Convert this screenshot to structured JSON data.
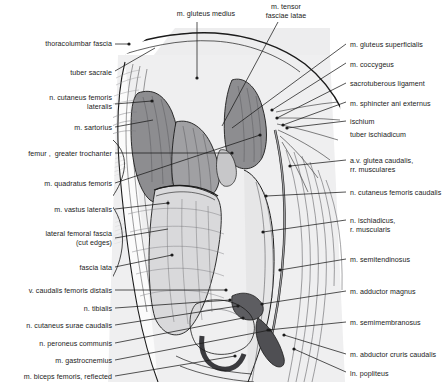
{
  "figure": {
    "background_color": "#ffffff",
    "illustration_tint": "#ececed",
    "muscle_fill_dark": "#8d8d90",
    "muscle_fill_mid": "#a8a8ab",
    "muscle_fill_light": "#c9c9cb",
    "line_color": "#1b1b1b",
    "label_color": "#1b1b1b"
  },
  "labels_top": [
    {
      "id": "m-gluteus-medius",
      "text": "m. gluteus medius",
      "x": 164,
      "y": 10,
      "align": "center",
      "width": 84
    },
    {
      "id": "m-tensor-fasciae-latae",
      "text": "m. tensor\nfasciae latae",
      "x": 253,
      "y": 3,
      "align": "center",
      "width": 66
    }
  ],
  "labels_left": [
    {
      "id": "thoracolumbar-fascia",
      "text": "thoracolumbar fascia",
      "x": 22,
      "y": 40,
      "width": 90
    },
    {
      "id": "tuber-sacrale",
      "text": "tuber sacrale",
      "x": 52,
      "y": 69,
      "width": 60
    },
    {
      "id": "n-cutaneus-femoris-lateralis",
      "text": "n. cutaneus femoris\nlateralis",
      "x": 22,
      "y": 94,
      "width": 90
    },
    {
      "id": "m-sartorius",
      "text": "m. sartorius",
      "x": 52,
      "y": 124,
      "width": 60
    },
    {
      "id": "femur-greater-trochanter",
      "text": "femur ,  greater trochanter",
      "x": 2,
      "y": 150,
      "width": 110
    },
    {
      "id": "m-quadratus-femoris",
      "text": "m. quadratus femoris",
      "x": 22,
      "y": 180,
      "width": 90
    },
    {
      "id": "m-vastus-lateralis",
      "text": "m. vastus lateralis",
      "x": 32,
      "y": 206,
      "width": 80
    },
    {
      "id": "lateral-femoral-fascia",
      "text": "lateral femoral fascia\n(cut edges)",
      "x": 22,
      "y": 230,
      "width": 90
    },
    {
      "id": "fascia-lata",
      "text": "fascia lata",
      "x": 52,
      "y": 264,
      "width": 60
    },
    {
      "id": "v-caudalis-femoris-distalis",
      "text": "v. caudalis femoris distalis",
      "x": 9,
      "y": 287,
      "width": 103
    },
    {
      "id": "n-tibialis",
      "text": "n. tibialis",
      "x": 62,
      "y": 305,
      "width": 50
    },
    {
      "id": "n-cutaneus-surae-caudalis",
      "text": "n. cutaneus surae caudalis",
      "x": 8,
      "y": 322,
      "width": 104
    },
    {
      "id": "n-peroneus-communis",
      "text": "n. peroneus communis",
      "x": 20,
      "y": 340,
      "width": 92
    },
    {
      "id": "m-gastrocnemius",
      "text": "m. gastrocnemius",
      "x": 36,
      "y": 357,
      "width": 76
    },
    {
      "id": "m-biceps-femoris-reflected",
      "text": "m. biceps femoris, reflected",
      "x": 5,
      "y": 373,
      "width": 107
    }
  ],
  "labels_right": [
    {
      "id": "m-gluteus-superficialis",
      "text": "m. gluteus superficialis",
      "x": 350,
      "y": 41,
      "width": 93
    },
    {
      "id": "m-coccygeus",
      "text": "m. coccygeus",
      "x": 350,
      "y": 61,
      "width": 93
    },
    {
      "id": "sacrotuberous-ligament",
      "text": "sacrotuberous ligament",
      "x": 350,
      "y": 80,
      "width": 93
    },
    {
      "id": "m-sphincter-ani-externus",
      "text": "m. sphincter ani externus",
      "x": 350,
      "y": 100,
      "width": 93
    },
    {
      "id": "ischium",
      "text": "ischium",
      "x": 350,
      "y": 118,
      "width": 93
    },
    {
      "id": "tuber-ischiadicum",
      "text": "tuber ischiadicum",
      "x": 350,
      "y": 131,
      "width": 93
    },
    {
      "id": "av-glutea-caudalis",
      "text": "a.v. glutea caudalis,\nrr. musculares",
      "x": 350,
      "y": 157,
      "width": 93
    },
    {
      "id": "n-cutaneus-femoris-caudalis",
      "text": "n. cutaneus femoris caudalis",
      "x": 350,
      "y": 189,
      "width": 93
    },
    {
      "id": "n-ischiadicus-r-muscularis",
      "text": "n. ischiadicus,\nr. muscularis",
      "x": 350,
      "y": 217,
      "width": 93
    },
    {
      "id": "m-semitendinosus",
      "text": "m. semitendinosus",
      "x": 350,
      "y": 256,
      "width": 93
    },
    {
      "id": "m-adductor-magnus",
      "text": "m. adductor magnus",
      "x": 350,
      "y": 288,
      "width": 93
    },
    {
      "id": "m-semimembranosus",
      "text": "m. semimembranosus",
      "x": 350,
      "y": 319,
      "width": 93
    },
    {
      "id": "m-abductor-cruris-caudalis",
      "text": "m. abductor cruris caudalis",
      "x": 350,
      "y": 351,
      "width": 93
    },
    {
      "id": "ln-popliteus",
      "text": "ln. popliteus",
      "x": 350,
      "y": 370,
      "width": 93
    }
  ],
  "leader_lines": [
    {
      "id": "ll-thoracolumbar-fascia",
      "from": [
        115,
        44
      ],
      "to": [
        128,
        44
      ],
      "dot": [
        129,
        44
      ]
    },
    {
      "id": "ll-tuber-sacrale",
      "from": [
        115,
        71
      ],
      "to": [
        155,
        48
      ],
      "dot": null
    },
    {
      "id": "ll-n-cutaneus-femoris-lateralis",
      "from": [
        115,
        104
      ],
      "to": [
        152,
        101
      ],
      "dot": [
        152,
        101
      ]
    },
    {
      "id": "ll-m-sartorius",
      "from": [
        115,
        127
      ],
      "to": [
        153,
        120
      ],
      "dot": null
    },
    {
      "id": "ll-femur-greater-trochanter",
      "from": [
        115,
        153
      ],
      "to": [
        232,
        153
      ],
      "dot": [
        232,
        153
      ]
    },
    {
      "id": "ll-m-quadratus-femoris",
      "from": [
        115,
        183
      ],
      "to": [
        260,
        135
      ],
      "dot": [
        260,
        135
      ]
    },
    {
      "id": "ll-m-vastus-lateralis",
      "from": [
        115,
        209
      ],
      "to": [
        168,
        203
      ],
      "dot": [
        168,
        203
      ]
    },
    {
      "id": "ll-lateral-femoral-fascia",
      "from": [
        115,
        238
      ],
      "to": [
        168,
        229
      ],
      "dot": null
    },
    {
      "id": "ll-fascia-lata",
      "from": [
        115,
        267
      ],
      "to": [
        172,
        255
      ],
      "dot": [
        172,
        255
      ]
    },
    {
      "id": "ll-v-caudalis-femoris-distalis",
      "from": [
        115,
        290
      ],
      "to": [
        226,
        290
      ],
      "dot": [
        226,
        290
      ]
    },
    {
      "id": "ll-n-tibialis",
      "from": [
        115,
        308
      ],
      "to": [
        230,
        300
      ],
      "dot": [
        230,
        300
      ]
    },
    {
      "id": "ll-n-cutaneus-surae-caudalis",
      "from": [
        115,
        325
      ],
      "to": [
        238,
        306
      ],
      "dot": [
        238,
        306
      ]
    },
    {
      "id": "ll-n-peroneus-communis",
      "from": [
        115,
        343
      ],
      "to": [
        243,
        318
      ],
      "dot": [
        243,
        318
      ]
    },
    {
      "id": "ll-m-gastrocnemius",
      "from": [
        115,
        360
      ],
      "to": [
        270,
        330
      ],
      "dot": [
        270,
        330
      ]
    },
    {
      "id": "ll-m-biceps-femoris-reflected",
      "from": [
        115,
        376
      ],
      "to": [
        235,
        356
      ],
      "dot": [
        235,
        356
      ]
    },
    {
      "id": "ll-m-gluteus-medius",
      "from": [
        197,
        22
      ],
      "to": [
        197,
        78
      ],
      "dot": [
        197,
        78
      ]
    },
    {
      "id": "ll-m-tensor-fasciae-latae",
      "from": [
        278,
        22
      ],
      "to": [
        222,
        126
      ],
      "dot": null
    },
    {
      "id": "ll-m-gluteus-superficialis",
      "from": [
        346,
        44
      ],
      "to": [
        232,
        128
      ],
      "dot": null
    },
    {
      "id": "ll-m-coccygeus",
      "from": [
        346,
        63
      ],
      "to": [
        272,
        110
      ],
      "dot": [
        272,
        110
      ]
    },
    {
      "id": "ll-sacrotuberous-ligament",
      "from": [
        346,
        83
      ],
      "to": [
        277,
        118
      ],
      "dot": [
        277,
        118
      ]
    },
    {
      "id": "ll-m-sphincter-ani-externus",
      "from": [
        346,
        102
      ],
      "to": [
        283,
        125
      ],
      "dot": [
        283,
        125
      ]
    },
    {
      "id": "ll-ischium",
      "from": [
        346,
        121
      ],
      "to": [
        287,
        128
      ],
      "dot": [
        287,
        128
      ]
    },
    {
      "id": "ll-av-glutea-caudalis",
      "from": [
        346,
        160
      ],
      "to": [
        290,
        166
      ],
      "dot": [
        290,
        166
      ]
    },
    {
      "id": "ll-n-cutaneus-femoris-caudalis",
      "from": [
        346,
        192
      ],
      "to": [
        266,
        196
      ],
      "dot": [
        266,
        196
      ]
    },
    {
      "id": "ll-n-ischiadicus",
      "from": [
        346,
        220
      ],
      "to": [
        263,
        232
      ],
      "dot": [
        263,
        232
      ]
    },
    {
      "id": "ll-m-semitendinosus",
      "from": [
        346,
        259
      ],
      "to": [
        280,
        270
      ],
      "dot": [
        280,
        270
      ]
    },
    {
      "id": "ll-m-adductor-magnus",
      "from": [
        346,
        291
      ],
      "to": [
        262,
        304
      ],
      "dot": [
        262,
        304
      ]
    },
    {
      "id": "ll-m-semimembranosus",
      "from": [
        346,
        322
      ],
      "to": [
        268,
        330
      ],
      "dot": [
        268,
        330
      ]
    },
    {
      "id": "ll-m-abductor-cruris-caudalis",
      "from": [
        346,
        354
      ],
      "to": [
        284,
        335
      ],
      "dot": [
        284,
        335
      ]
    },
    {
      "id": "ll-ln-popliteus",
      "from": [
        346,
        372
      ],
      "to": [
        294,
        349
      ],
      "dot": [
        294,
        349
      ]
    }
  ]
}
